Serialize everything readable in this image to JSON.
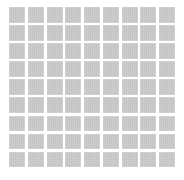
{
  "grid": {
    "rows": 9,
    "columns": 9,
    "tile_color": "#c9c9c9",
    "background_color": "#ffffff"
  }
}
